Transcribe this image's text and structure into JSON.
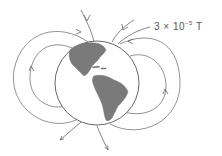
{
  "diagram": {
    "field_label": {
      "coefficient": "3",
      "times": "×",
      "base": "10",
      "exponent": "−5",
      "unit": "T"
    },
    "colors": {
      "line": "#666666",
      "land": "#7a7a7a",
      "globe_outline": "#555555",
      "text": "#555555"
    }
  }
}
